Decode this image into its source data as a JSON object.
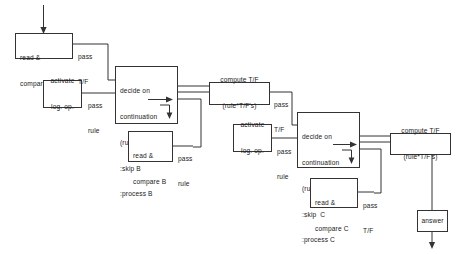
{
  "diagram": {
    "colors": {
      "stroke": "#333333",
      "text": "#1a1a1a",
      "background": "#ffffff"
    }
  },
  "nodes": {
    "read_compare_a": {
      "line1": "read &",
      "line2": "compare A"
    },
    "decide_b": {
      "line1": "decide on",
      "line2": "continuation",
      "line3": "(rule*T/F)",
      "line4": ":skip B",
      "line5": ":process B"
    },
    "activate_1": {
      "line1": "activate",
      "line2": "log. op."
    },
    "compute_1": {
      "line1": "compute T/F",
      "line2": "(rule*T/F's)"
    },
    "read_compare_b": {
      "line1": "read &",
      "line2": "compare B"
    },
    "activate_2": {
      "line1": "activate",
      "line2": "log. op."
    },
    "decide_c": {
      "line1": "decide on",
      "line2": "continuation",
      "line3": "(rule*T/F)",
      "line4": ":skip  C",
      "line5": ":process C"
    },
    "read_compare_c": {
      "line1": "read &",
      "line2": "compare C"
    },
    "compute_2": {
      "line1": "compute T/F",
      "line2": "(rule*T/F's)"
    },
    "answer": {
      "line1": "answer"
    }
  },
  "edge_labels": {
    "a_out": {
      "line1": "pass",
      "line2": "T/F"
    },
    "activate1_out": {
      "line1": "pass",
      "line2": "rule"
    },
    "compute1_out": {
      "line1": "pass",
      "line2": "T/F"
    },
    "b_out": {
      "line1": "pass",
      "line2": "rule"
    },
    "activate2_out": {
      "line1": "pass",
      "line2": "rule"
    },
    "c_out": {
      "line1": "pass",
      "line2": "T/F"
    }
  }
}
